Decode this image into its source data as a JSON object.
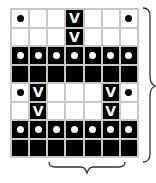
{
  "diagram": {
    "type": "knitting-chart",
    "columns": 7,
    "rows": 8,
    "legend": {
      "W": "white cell",
      "B": "black cell",
      "Wd": "white cell with black dot",
      "Bd": "black cell with white dot",
      "Bv": "black cell with white V (slip stitch)"
    },
    "grid": [
      [
        "Wd",
        "W",
        "W",
        "Bv",
        "W",
        "W",
        "Wd"
      ],
      [
        "W",
        "W",
        "W",
        "Bv",
        "W",
        "W",
        "W"
      ],
      [
        "Bd",
        "Bd",
        "Bd",
        "Bd",
        "Bd",
        "Bd",
        "Bd"
      ],
      [
        "B",
        "B",
        "B",
        "B",
        "B",
        "B",
        "B"
      ],
      [
        "Wd",
        "Bv",
        "W",
        "W",
        "W",
        "Bv",
        "Wd"
      ],
      [
        "W",
        "Bv",
        "W",
        "W",
        "W",
        "Bv",
        "W"
      ],
      [
        "Bd",
        "Bd",
        "Bd",
        "Bd",
        "Bd",
        "Bd",
        "Bd"
      ],
      [
        "B",
        "B",
        "B",
        "B",
        "B",
        "B",
        "B"
      ]
    ],
    "v_glyph": "V",
    "right_brace": "spans all 8 rows (repeat rows)",
    "bottom_brace": "spans columns 2-6 (repeat stitches)",
    "colors": {
      "grid_line": "#c8c8c8",
      "dark": "#000000",
      "light": "#ffffff"
    }
  }
}
